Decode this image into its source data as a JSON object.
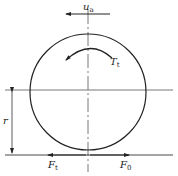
{
  "diagram": {
    "type": "wheel-force-diagram",
    "labels": {
      "velocity": {
        "main": "u",
        "sub": "a"
      },
      "torque": {
        "main": "T",
        "sub": "t"
      },
      "radius": {
        "main": "r"
      },
      "tractive_force": {
        "main": "F",
        "sub": "t"
      },
      "rolling_force": {
        "main": "F",
        "sub": "0"
      }
    },
    "colors": {
      "line": "#222222",
      "centerline": "#555555",
      "background": "#ffffff"
    }
  }
}
